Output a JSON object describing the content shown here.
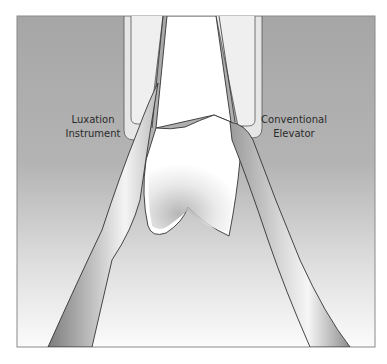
{
  "figure": {
    "type": "illustration",
    "colors": {
      "background_top": "#a6a6a6",
      "background_bottom": "#fbfbfb",
      "socket_fill": "#e9e9e9",
      "tooth_fill": "#ffffff",
      "outline": "#3a3a3a",
      "frame_border": "#8a8a8a"
    }
  },
  "labels": {
    "left": {
      "line1": "Luxation",
      "line2": "Instrument"
    },
    "right": {
      "line1": "Conventional",
      "line2": "Elevator"
    }
  }
}
